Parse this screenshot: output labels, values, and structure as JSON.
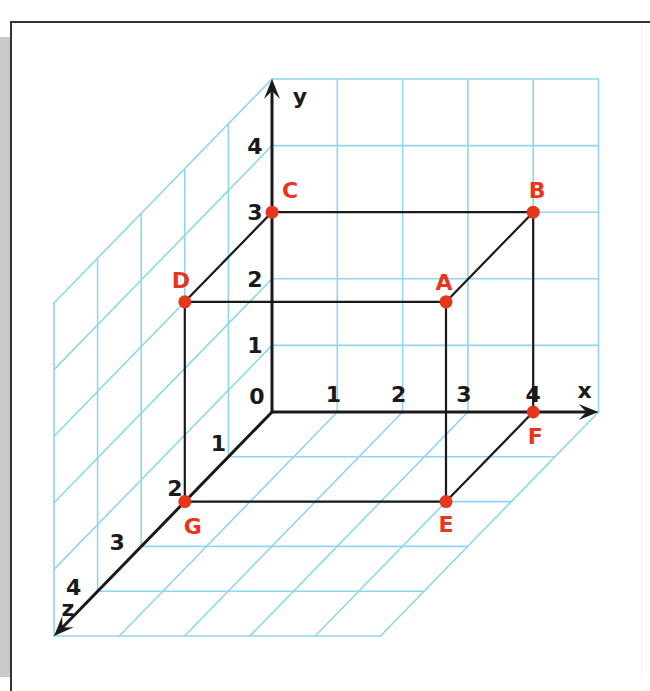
{
  "colors": {
    "grid": "#8fd6ee",
    "axis": "#1a1a1a",
    "point": "#e8361c",
    "edge": "#1a1a1a"
  },
  "geometry": {
    "origin": [
      272,
      412
    ],
    "unit_x": [
      65.3,
      0
    ],
    "unit_y": [
      0,
      -66.6
    ],
    "unit_z": [
      -43.6,
      44.8
    ],
    "grid_extent": 5
  },
  "axes": {
    "x": {
      "label": "x",
      "ticks": [
        "1",
        "2",
        "3",
        "4"
      ]
    },
    "y": {
      "label": "y",
      "ticks": [
        "1",
        "2",
        "3",
        "4"
      ]
    },
    "z": {
      "label": "z",
      "ticks": [
        "1",
        "2",
        "3",
        "4"
      ]
    },
    "origin_label": "0"
  },
  "points": [
    {
      "name": "A",
      "coords": [
        4,
        3,
        2
      ]
    },
    {
      "name": "B",
      "coords": [
        4,
        3,
        0
      ]
    },
    {
      "name": "C",
      "coords": [
        0,
        3,
        0
      ]
    },
    {
      "name": "D",
      "coords": [
        0,
        3,
        2
      ]
    },
    {
      "name": "E",
      "coords": [
        4,
        0,
        2
      ]
    },
    {
      "name": "F",
      "coords": [
        4,
        0,
        0
      ]
    },
    {
      "name": "G",
      "coords": [
        0,
        0,
        2
      ]
    }
  ],
  "edges": [
    [
      "C",
      "B"
    ],
    [
      "D",
      "A"
    ],
    [
      "C",
      "D"
    ],
    [
      "B",
      "A"
    ],
    [
      "A",
      "E"
    ],
    [
      "B",
      "F"
    ],
    [
      "D",
      "G"
    ],
    [
      "G",
      "E"
    ],
    [
      "E",
      "F"
    ]
  ]
}
